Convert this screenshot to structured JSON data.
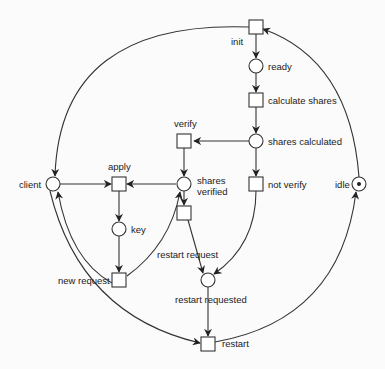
{
  "diagram": {
    "type": "petri-net",
    "colors": {
      "stroke": "#333333",
      "fill": "#ffffff",
      "background": "#fbfbfb",
      "text": "#222222"
    },
    "places": [
      {
        "id": "ready",
        "label": "ready",
        "x": 256,
        "y": 66,
        "tokens": 0
      },
      {
        "id": "shares_calculated",
        "label": "shares calculated",
        "x": 256,
        "y": 141,
        "tokens": 0
      },
      {
        "id": "shares_verified",
        "label1": "shares",
        "label2": "verified",
        "x": 183,
        "y": 184,
        "tokens": 0
      },
      {
        "id": "client",
        "label": "client",
        "x": 53,
        "y": 184,
        "tokens": 0
      },
      {
        "id": "key",
        "label": "key",
        "x": 119,
        "y": 229,
        "tokens": 0
      },
      {
        "id": "restart_requested",
        "label": "restart requested",
        "x": 208,
        "y": 280,
        "tokens": 0
      },
      {
        "id": "idle",
        "label": "idle",
        "x": 359,
        "y": 184,
        "tokens": 1
      }
    ],
    "transitions": [
      {
        "id": "init",
        "label": "init",
        "x": 256,
        "y": 27
      },
      {
        "id": "calculate_shares",
        "label": "calculate shares",
        "x": 256,
        "y": 100
      },
      {
        "id": "verify",
        "label": "verify",
        "x": 186,
        "y": 141
      },
      {
        "id": "not_verify",
        "label": "not verify",
        "x": 256,
        "y": 184
      },
      {
        "id": "apply",
        "label": "apply",
        "x": 119,
        "y": 184
      },
      {
        "id": "restart_request",
        "label": "restart request",
        "x": 183,
        "y": 213
      },
      {
        "id": "new_request",
        "label": "new request",
        "x": 119,
        "y": 280
      },
      {
        "id": "restart",
        "label": "restart",
        "x": 208,
        "y": 344
      }
    ],
    "arcs": [
      [
        "init",
        "ready"
      ],
      [
        "ready",
        "calculate_shares"
      ],
      [
        "calculate_shares",
        "shares_calculated"
      ],
      [
        "shares_calculated",
        "verify"
      ],
      [
        "shares_calculated",
        "not_verify"
      ],
      [
        "verify",
        "shares_verified"
      ],
      [
        "shares_verified",
        "apply"
      ],
      [
        "client",
        "apply"
      ],
      [
        "apply",
        "key"
      ],
      [
        "key",
        "new_request"
      ],
      [
        "new_request",
        "client"
      ],
      [
        "new_request",
        "shares_verified"
      ],
      [
        "shares_verified",
        "restart_request"
      ],
      [
        "restart_request",
        "restart_requested"
      ],
      [
        "not_verify",
        "restart_requested"
      ],
      [
        "restart_requested",
        "restart"
      ],
      [
        "client",
        "restart"
      ],
      [
        "restart",
        "idle"
      ],
      [
        "idle",
        "init"
      ],
      [
        "init",
        "client"
      ]
    ]
  }
}
